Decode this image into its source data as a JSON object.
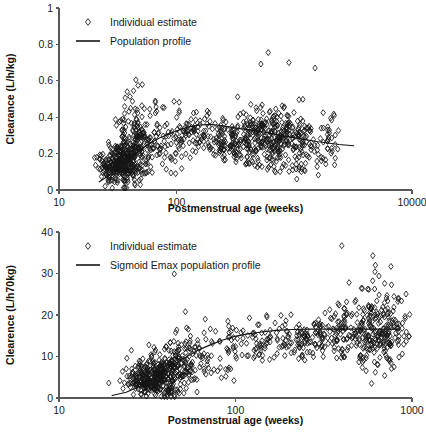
{
  "figure": {
    "panels": [
      "top",
      "bottom"
    ]
  },
  "chart_data": [
    {
      "id": "top",
      "type": "scatter",
      "title": "",
      "xlabel": "Postmenstrual age (weeks)",
      "ylabel": "Clearance (L/h/kg)",
      "xscale": "log",
      "xlim": [
        10,
        10000
      ],
      "ylim": [
        0,
        1
      ],
      "xticks": [
        10,
        100,
        10000
      ],
      "xticklabels": [
        "10",
        "100",
        "10000"
      ],
      "yticks": [
        0,
        0.2,
        0.4,
        0.6,
        0.8,
        1
      ],
      "yticklabels": [
        "0",
        "0.2",
        "0.4",
        "0.6",
        "0.8",
        "1"
      ],
      "grid": false,
      "legend_position": "top-left",
      "legend": [
        {
          "label": "Individual estimate",
          "marker": "open-diamond"
        },
        {
          "label": "Population profile",
          "marker": "line"
        }
      ],
      "series": [
        {
          "name": "Individual estimate",
          "marker": "open-diamond",
          "generator": {
            "kind": "clusters",
            "seed": 20317,
            "clusters": [
              {
                "n": 260,
                "x_center": 33,
                "x_spread": 0.085,
                "y_center": 0.135,
                "y_spread": 0.055,
                "y_min": 0.01,
                "y_max": 0.3
              },
              {
                "n": 120,
                "x_center": 41,
                "x_spread": 0.075,
                "y_center": 0.225,
                "y_spread": 0.09,
                "y_min": 0.03,
                "y_max": 0.56
              },
              {
                "n": 55,
                "x_center": 47,
                "x_spread": 0.055,
                "y_center": 0.33,
                "y_spread": 0.11,
                "y_min": 0.08,
                "y_max": 0.61
              },
              {
                "n": 45,
                "x_center": 62,
                "x_spread": 0.08,
                "y_center": 0.245,
                "y_spread": 0.085,
                "y_min": 0.1,
                "y_max": 0.47
              },
              {
                "n": 30,
                "x_center": 80,
                "x_spread": 0.075,
                "y_center": 0.285,
                "y_spread": 0.09,
                "y_min": 0.09,
                "y_max": 0.49
              },
              {
                "n": 28,
                "x_center": 110,
                "x_spread": 0.055,
                "y_center": 0.3,
                "y_spread": 0.07,
                "y_min": 0.16,
                "y_max": 0.44
              },
              {
                "n": 34,
                "x_center": 140,
                "x_spread": 0.04,
                "y_center": 0.305,
                "y_spread": 0.07,
                "y_min": 0.17,
                "y_max": 0.45
              },
              {
                "n": 30,
                "x_center": 180,
                "x_spread": 0.04,
                "y_center": 0.3,
                "y_spread": 0.065,
                "y_min": 0.18,
                "y_max": 0.44
              },
              {
                "n": 46,
                "x_center": 240,
                "x_spread": 0.035,
                "y_center": 0.262,
                "y_spread": 0.06,
                "y_min": 0.16,
                "y_max": 0.42
              },
              {
                "n": 40,
                "x_center": 300,
                "x_spread": 0.03,
                "y_center": 0.252,
                "y_spread": 0.055,
                "y_min": 0.15,
                "y_max": 0.38
              },
              {
                "n": 60,
                "x_center": 390,
                "x_spread": 0.04,
                "y_center": 0.285,
                "y_spread": 0.075,
                "y_min": 0.14,
                "y_max": 0.52
              },
              {
                "n": 80,
                "x_center": 520,
                "x_spread": 0.055,
                "y_center": 0.29,
                "y_spread": 0.085,
                "y_min": 0.12,
                "y_max": 0.53
              },
              {
                "n": 130,
                "x_center": 720,
                "x_spread": 0.07,
                "y_center": 0.285,
                "y_spread": 0.09,
                "y_min": 0.08,
                "y_max": 0.56
              },
              {
                "n": 90,
                "x_center": 1100,
                "x_spread": 0.075,
                "y_center": 0.275,
                "y_spread": 0.08,
                "y_min": 0.1,
                "y_max": 0.5
              },
              {
                "n": 40,
                "x_center": 1900,
                "x_spread": 0.07,
                "y_center": 0.268,
                "y_spread": 0.07,
                "y_min": 0.12,
                "y_max": 0.45
              }
            ],
            "outliers": [
              {
                "x": 45,
                "y": 0.605
              },
              {
                "x": 47,
                "y": 0.575
              },
              {
                "x": 43,
                "y": 0.545
              },
              {
                "x": 38,
                "y": 0.54
              },
              {
                "x": 95,
                "y": 0.487
              },
              {
                "x": 105,
                "y": 0.482
              },
              {
                "x": 600,
                "y": 0.755
              },
              {
                "x": 520,
                "y": 0.692
              },
              {
                "x": 900,
                "y": 0.7
              },
              {
                "x": 1500,
                "y": 0.67
              },
              {
                "x": 330,
                "y": 0.512
              },
              {
                "x": 1050,
                "y": 0.06
              },
              {
                "x": 1600,
                "y": 0.082
              },
              {
                "x": 98,
                "y": 0.09
              },
              {
                "x": 88,
                "y": 0.18
              }
            ]
          }
        }
      ],
      "profile": {
        "name": "Population profile",
        "points": [
          [
            22,
            0.045
          ],
          [
            26,
            0.075
          ],
          [
            30,
            0.105
          ],
          [
            35,
            0.14
          ],
          [
            40,
            0.175
          ],
          [
            46,
            0.205
          ],
          [
            52,
            0.232
          ],
          [
            60,
            0.258
          ],
          [
            70,
            0.283
          ],
          [
            80,
            0.3
          ],
          [
            95,
            0.32
          ],
          [
            110,
            0.335
          ],
          [
            130,
            0.348
          ],
          [
            160,
            0.358
          ],
          [
            200,
            0.36
          ],
          [
            250,
            0.352
          ],
          [
            320,
            0.34
          ],
          [
            420,
            0.33
          ],
          [
            560,
            0.318
          ],
          [
            760,
            0.3
          ],
          [
            1100,
            0.282
          ],
          [
            1600,
            0.265
          ],
          [
            2400,
            0.25
          ],
          [
            3200,
            0.243
          ]
        ]
      }
    },
    {
      "id": "bottom",
      "type": "scatter",
      "title": "",
      "xlabel": "Postmenstrual age (weeks)",
      "ylabel": "Clearence (L/h70kg)",
      "xscale": "log",
      "xlim": [
        10,
        1000
      ],
      "ylim": [
        0,
        40
      ],
      "xticks": [
        10,
        100,
        1000
      ],
      "xticklabels": [
        "10",
        "100",
        "1000"
      ],
      "yticks": [
        0,
        10,
        20,
        30,
        40
      ],
      "yticklabels": [
        "0",
        "10",
        "20",
        "30",
        "40"
      ],
      "grid": false,
      "legend_position": "top-left",
      "legend": [
        {
          "label": "Individual estimate",
          "marker": "open-diamond"
        },
        {
          "label": "Sigmoid Emax population profile",
          "marker": "line"
        }
      ],
      "series": [
        {
          "name": "Individual estimate",
          "marker": "open-diamond",
          "generator": {
            "kind": "clusters",
            "seed": 91733,
            "clusters": [
              {
                "n": 280,
                "x_center": 34,
                "x_spread": 0.08,
                "y_center": 4.4,
                "y_spread": 2.1,
                "y_min": 0.3,
                "y_max": 11.5
              },
              {
                "n": 110,
                "x_center": 41,
                "x_spread": 0.07,
                "y_center": 6.6,
                "y_spread": 3.0,
                "y_min": 1.0,
                "y_max": 17.5
              },
              {
                "n": 55,
                "x_center": 48,
                "x_spread": 0.055,
                "y_center": 10.5,
                "y_spread": 3.6,
                "y_min": 3.5,
                "y_max": 20.8
              },
              {
                "n": 38,
                "x_center": 62,
                "x_spread": 0.07,
                "y_center": 9.0,
                "y_spread": 3.2,
                "y_min": 4.0,
                "y_max": 16.5
              },
              {
                "n": 26,
                "x_center": 80,
                "x_spread": 0.07,
                "y_center": 12.0,
                "y_spread": 3.4,
                "y_min": 4.2,
                "y_max": 19.5
              },
              {
                "n": 26,
                "x_center": 110,
                "x_spread": 0.05,
                "y_center": 13.6,
                "y_spread": 3.0,
                "y_min": 8.5,
                "y_max": 19.0
              },
              {
                "n": 32,
                "x_center": 140,
                "x_spread": 0.04,
                "y_center": 14.2,
                "y_spread": 3.0,
                "y_min": 9.0,
                "y_max": 20.0
              },
              {
                "n": 30,
                "x_center": 180,
                "x_spread": 0.04,
                "y_center": 14.8,
                "y_spread": 2.9,
                "y_min": 9.5,
                "y_max": 20.2
              },
              {
                "n": 44,
                "x_center": 240,
                "x_spread": 0.035,
                "y_center": 14.0,
                "y_spread": 2.8,
                "y_min": 9.0,
                "y_max": 18.5
              },
              {
                "n": 40,
                "x_center": 300,
                "x_spread": 0.03,
                "y_center": 14.4,
                "y_spread": 2.6,
                "y_min": 9.5,
                "y_max": 18.0
              },
              {
                "n": 58,
                "x_center": 390,
                "x_spread": 0.04,
                "y_center": 15.6,
                "y_spread": 4.0,
                "y_min": 8.0,
                "y_max": 24.5
              },
              {
                "n": 78,
                "x_center": 520,
                "x_spread": 0.055,
                "y_center": 16.2,
                "y_spread": 4.6,
                "y_min": 6.0,
                "y_max": 27.0
              },
              {
                "n": 110,
                "x_center": 640,
                "x_spread": 0.06,
                "y_center": 17.0,
                "y_spread": 5.2,
                "y_min": 6.5,
                "y_max": 30.5
              },
              {
                "n": 70,
                "x_center": 760,
                "x_spread": 0.055,
                "y_center": 16.0,
                "y_spread": 4.4,
                "y_min": 8.0,
                "y_max": 25.0
              }
            ],
            "outliers": [
              {
                "x": 45,
                "y": 29.9
              },
              {
                "x": 400,
                "y": 36.7
              },
              {
                "x": 600,
                "y": 34.3
              },
              {
                "x": 620,
                "y": 32.0
              },
              {
                "x": 760,
                "y": 31.7
              },
              {
                "x": 650,
                "y": 29.4
              },
              {
                "x": 440,
                "y": 27.8
              },
              {
                "x": 88,
                "y": 6.9
              },
              {
                "x": 98,
                "y": 4.2
              },
              {
                "x": 590,
                "y": 3.5
              },
              {
                "x": 620,
                "y": 6.2
              },
              {
                "x": 700,
                "y": 5.4
              },
              {
                "x": 52,
                "y": 20.8
              },
              {
                "x": 120,
                "y": 19.3
              },
              {
                "x": 150,
                "y": 19.9
              }
            ]
          }
        }
      ],
      "profile": {
        "name": "Sigmoid Emax population profile",
        "points": [
          [
            20,
            0.6
          ],
          [
            24,
            1.4
          ],
          [
            28,
            2.6
          ],
          [
            32,
            4.0
          ],
          [
            36,
            5.5
          ],
          [
            41,
            7.1
          ],
          [
            47,
            8.7
          ],
          [
            54,
            10.2
          ],
          [
            62,
            11.6
          ],
          [
            72,
            12.8
          ],
          [
            84,
            13.9
          ],
          [
            98,
            14.8
          ],
          [
            115,
            15.4
          ],
          [
            140,
            15.9
          ],
          [
            170,
            16.3
          ],
          [
            210,
            16.5
          ],
          [
            260,
            16.6
          ],
          [
            330,
            16.6
          ],
          [
            420,
            16.6
          ],
          [
            540,
            16.6
          ],
          [
            700,
            16.6
          ],
          [
            850,
            16.6
          ]
        ]
      }
    }
  ]
}
